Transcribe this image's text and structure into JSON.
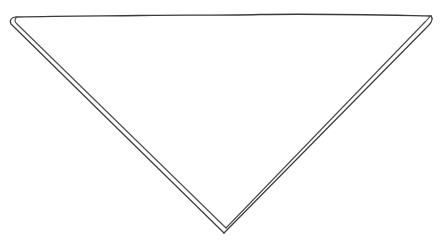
{
  "drawing": {
    "subject": "inverted triangle",
    "style": "hand-drawn pencil sketch",
    "background": "#ffffff",
    "stroke_color": "#3a3a3a",
    "vertices": {
      "top_left": [
        11,
        19
      ],
      "top_right": [
        431,
        16
      ],
      "bottom": [
        225,
        233
      ]
    },
    "edges": [
      {
        "name": "top-edge",
        "lines": 1
      },
      {
        "name": "left-edge",
        "lines": 2
      },
      {
        "name": "right-edge",
        "lines": 2
      }
    ]
  }
}
